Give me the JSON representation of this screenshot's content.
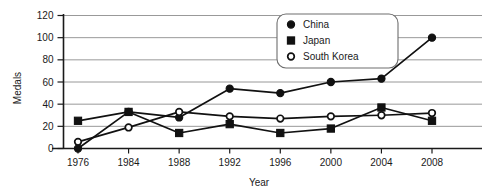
{
  "chart_data": {
    "type": "line",
    "title": "",
    "xlabel": "Year",
    "ylabel": "Medals",
    "categories": [
      "1976",
      "1984",
      "1988",
      "1992",
      "1996",
      "2000",
      "2004",
      "2008"
    ],
    "x": [
      1976,
      1984,
      1988,
      1992,
      1996,
      2000,
      2004,
      2008
    ],
    "ylim": [
      0,
      120
    ],
    "yticks": [
      0,
      20,
      40,
      60,
      80,
      100,
      120
    ],
    "ytick_labels": [
      "0",
      "20",
      "40",
      "60",
      "80",
      "100",
      "120"
    ],
    "grid": true,
    "legend_position": "top-right",
    "series": [
      {
        "name": "China",
        "marker": "filled-circle",
        "values": [
          0,
          33,
          28,
          54,
          50,
          60,
          63,
          100
        ]
      },
      {
        "name": "Japan",
        "marker": "filled-square",
        "values": [
          25,
          33,
          14,
          22,
          14,
          18,
          37,
          25
        ]
      },
      {
        "name": "South Korea",
        "marker": "open-circle",
        "values": [
          6,
          19,
          33,
          29,
          27,
          29,
          30,
          32
        ]
      }
    ]
  },
  "legend": {
    "entries": [
      {
        "label": "China",
        "marker": "filled-circle"
      },
      {
        "label": "Japan",
        "marker": "filled-square"
      },
      {
        "label": "South Korea",
        "marker": "open-circle"
      }
    ]
  },
  "colors": {
    "series": "#111111",
    "grid": "#8d8d8d",
    "axis": "#1a1a1a",
    "background": "#ffffff",
    "legend_border": "#6e6e6e"
  }
}
